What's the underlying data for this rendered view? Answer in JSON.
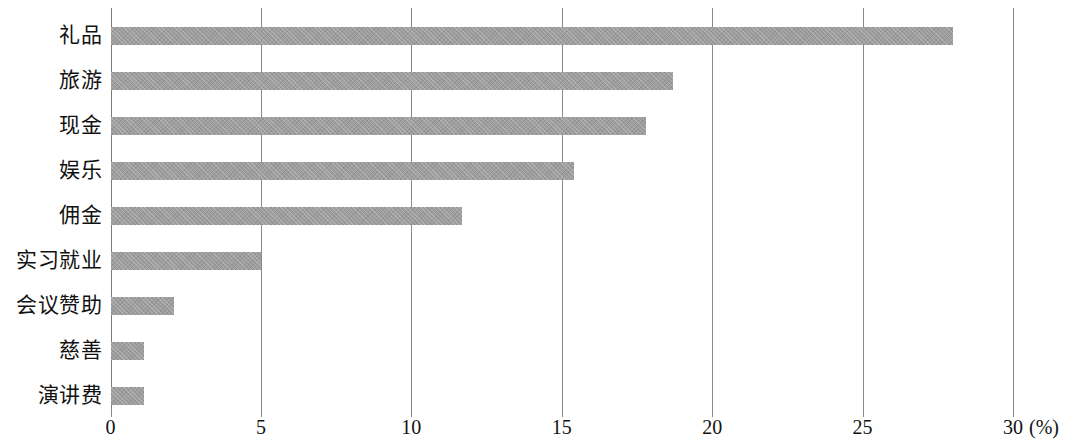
{
  "chart_data": {
    "type": "bar",
    "orientation": "horizontal",
    "title": "",
    "subtitle": "",
    "xlabel": "(%)",
    "ylabel": "",
    "categories": [
      "礼品",
      "旅游",
      "现金",
      "娱乐",
      "佣金",
      "实习就业",
      "会议赞助",
      "慈善",
      "演讲费"
    ],
    "values": [
      28.0,
      18.7,
      17.8,
      15.4,
      11.7,
      5.0,
      2.1,
      1.1,
      1.1
    ],
    "xlim": [
      0,
      30
    ],
    "xticks": [
      0,
      5,
      10,
      15,
      20,
      25,
      30
    ],
    "xtick_labels": [
      "0",
      "5",
      "10",
      "15",
      "20",
      "25",
      "30"
    ],
    "unit_label": "(%)",
    "grid": "vertical",
    "legend": null,
    "bar_color": "#9d9d9d",
    "axis_color": "#8a8a8a",
    "background_color": "#ffffff"
  }
}
